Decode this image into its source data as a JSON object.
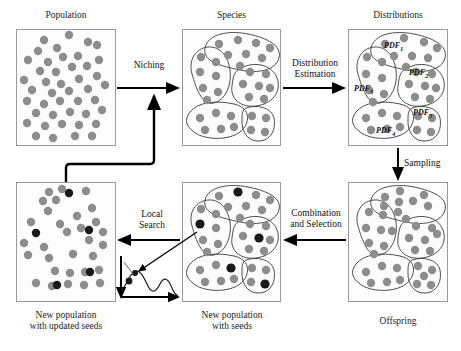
{
  "figure": {
    "type": "flow-diagram"
  },
  "panels": [
    {
      "id": "population",
      "caption": "Population",
      "caption_pos": "top",
      "x": 16,
      "y": 29,
      "w": 100,
      "h": 117,
      "kind": "dots"
    },
    {
      "id": "species",
      "caption": "Species",
      "caption_pos": "top",
      "x": 182,
      "y": 29,
      "w": 99,
      "h": 117,
      "kind": "niches"
    },
    {
      "id": "distributions",
      "caption": "Distributions",
      "caption_pos": "top",
      "x": 348,
      "y": 29,
      "w": 100,
      "h": 117,
      "kind": "niches-pdf"
    },
    {
      "id": "new-population-updated",
      "caption": "New population\nwith updated seeds",
      "caption_pos": "bottom",
      "x": 16,
      "y": 182,
      "w": 100,
      "h": 120,
      "kind": "dots-seeds"
    },
    {
      "id": "new-population-seeds",
      "caption": "New population\nwith seeds",
      "caption_pos": "bottom",
      "x": 182,
      "y": 182,
      "w": 99,
      "h": 120,
      "kind": "niches-seeds"
    },
    {
      "id": "offspring",
      "caption": "Offspring",
      "caption_pos": "bottom",
      "x": 348,
      "y": 182,
      "w": 100,
      "h": 120,
      "kind": "niches"
    }
  ],
  "captions": {
    "population": "Population",
    "species": "Species",
    "distributions": "Distributions",
    "new_population_updated_line1": "New population",
    "new_population_updated_line2": "with updated seeds",
    "new_population_seeds_line1": "New population",
    "new_population_seeds_line2": "with seeds",
    "offspring": "Offspring"
  },
  "arrows": [
    {
      "id": "niching",
      "label": "Niching",
      "label_lines": [
        "Niching"
      ],
      "from": "population",
      "to": "species",
      "direction": "right"
    },
    {
      "id": "distribution-estimation",
      "label": "Distribution Estimation",
      "label_lines": [
        "Distribution",
        "Estimation"
      ],
      "from": "species",
      "to": "distributions",
      "direction": "right"
    },
    {
      "id": "sampling",
      "label": "Sampling",
      "label_lines": [
        "Sampling"
      ],
      "from": "distributions",
      "to": "offspring",
      "direction": "down"
    },
    {
      "id": "combination-and-selection",
      "label": "Combination and Selection",
      "label_lines": [
        "Combination",
        "and Selection"
      ],
      "from": "offspring",
      "to": "new-population-seeds",
      "direction": "left"
    },
    {
      "id": "local-search",
      "label": "Local Search",
      "label_lines": [
        "Local",
        "Search"
      ],
      "from": "new-population-seeds",
      "to": "new-population-updated",
      "direction": "left"
    },
    {
      "id": "feedback-loop",
      "label": "",
      "label_lines": [],
      "from": "new-population-updated",
      "to": "niching",
      "direction": "loop-up"
    }
  ],
  "pdf_labels": [
    {
      "text": "PDF",
      "sub": "1",
      "x": 390,
      "y": 46
    },
    {
      "text": "PDF",
      "sub": "2",
      "x": 412,
      "y": 73
    },
    {
      "text": "PDF",
      "sub": "3",
      "x": 357,
      "y": 89
    },
    {
      "text": "PDF",
      "sub": "5",
      "x": 416,
      "y": 113
    },
    {
      "text": "PDF",
      "sub": "4",
      "x": 380,
      "y": 131
    }
  ],
  "legend": {
    "normal_individual": "gray circle",
    "seed_individual": "black circle",
    "niche_boundary": "thin closed contour",
    "local_search_inset": "1-D multimodal landscape with seed climbing to peak"
  },
  "colors": {
    "dot_gray": "#8d8d8d",
    "dot_dark": "#1a1a1a",
    "box_border": "#9a9a9a",
    "niche_line": "#3a3a3a",
    "arrow": "#000000",
    "background": "#ffffff",
    "text": "#111111"
  },
  "counts": {
    "population_dots": 44,
    "species_niches": 5,
    "distribution_niches": 5,
    "seeds_in_new_population": 5
  }
}
